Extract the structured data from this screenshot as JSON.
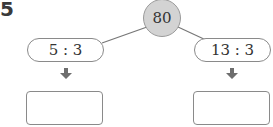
{
  "problem": {
    "number": "5"
  },
  "diagram": {
    "top_value": "80",
    "left_ratio": "5 : 3",
    "right_ratio": "13 : 3",
    "left_answer": "",
    "right_answer": ""
  },
  "colors": {
    "circle_fill": "#d3d3d3",
    "stroke": "#8a8a8a",
    "arrow": "#6e6e6e"
  }
}
